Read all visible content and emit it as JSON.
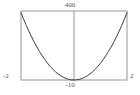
{
  "chart_data": {
    "type": "line",
    "title": "",
    "subtitle": "",
    "xlabel": "",
    "ylabel": "",
    "xlim": [
      -2,
      2
    ],
    "ylim": [
      -10,
      400
    ],
    "grid": false,
    "legend": null,
    "frame": true,
    "axis_lines": [
      "y-axis at x=0"
    ],
    "tick_labels": {
      "x": [
        "-2",
        "2"
      ],
      "y": [
        "400",
        "-10"
      ]
    },
    "annotations": [],
    "series": [
      {
        "name": "curve",
        "color": "#3c3c3c",
        "x": [
          -2.0,
          -1.9,
          -1.8,
          -1.7,
          -1.6,
          -1.5,
          -1.4,
          -1.3,
          -1.2,
          -1.1,
          -1.0,
          -0.9,
          -0.8,
          -0.7,
          -0.6,
          -0.5,
          -0.4,
          -0.3,
          -0.2,
          -0.1,
          0.0,
          0.1,
          0.2,
          0.3,
          0.4,
          0.5,
          0.6,
          0.7,
          0.8,
          0.9,
          1.0,
          1.1,
          1.2,
          1.3,
          1.4,
          1.5,
          1.6,
          1.7,
          1.8,
          1.9,
          2.0
        ],
        "y": [
          390,
          351,
          314,
          279,
          246,
          215,
          186,
          159,
          134,
          111,
          90,
          71,
          54,
          39,
          26,
          15,
          6,
          -1,
          -6,
          -9,
          -10,
          -9,
          -6,
          -1,
          6,
          15,
          26,
          39,
          54,
          71,
          90,
          111,
          134,
          159,
          186,
          215,
          246,
          279,
          314,
          351,
          390
        ]
      }
    ]
  },
  "labels": {
    "y_max": "400",
    "y_min": "-10",
    "x_min": "-2",
    "x_max": "2"
  },
  "colors": {
    "curve": "#3c3c3c",
    "frame": "#8a8a8a",
    "axis": "#8a8a8a",
    "text": "#545454",
    "background": "#ffffff"
  }
}
